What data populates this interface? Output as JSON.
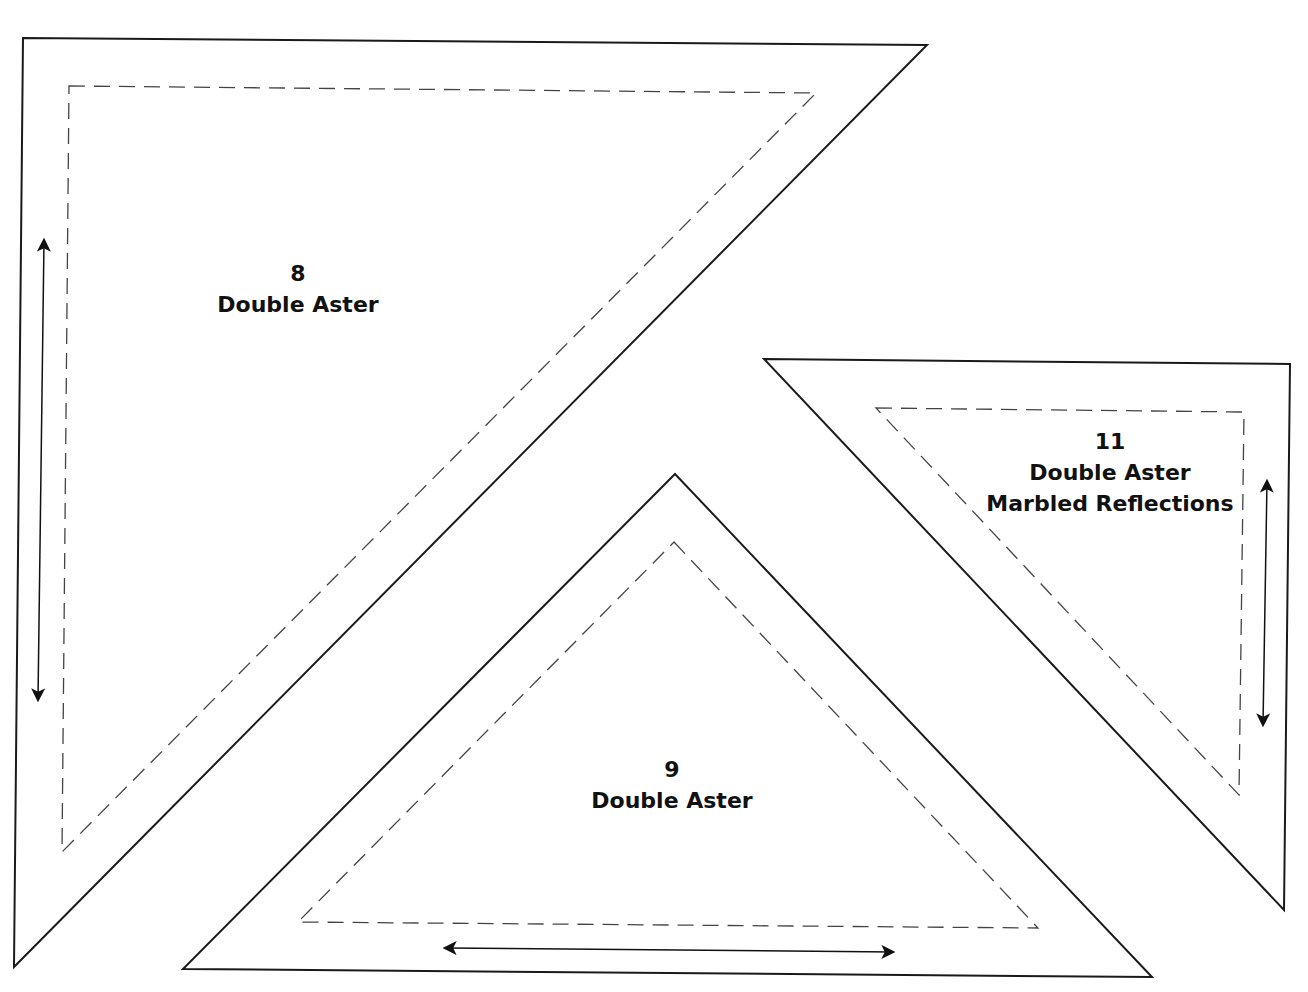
{
  "colors": {
    "background": "#ffffff",
    "cut_line": "#1a1a1a",
    "seam_line": "#444444",
    "grain_arrow": "#111111",
    "text": "#111111"
  },
  "pieces": [
    {
      "number": "8",
      "name": "Double Aster",
      "fabric": "",
      "grain_arrow": "vertical",
      "cut_outline": [
        [
          23,
          38
        ],
        [
          927,
          45
        ],
        [
          14,
          967
        ]
      ],
      "seam_outline": [
        [
          69,
          86
        ],
        [
          816,
          93
        ],
        [
          62,
          852
        ]
      ],
      "arrow": [
        [
          44,
          240
        ],
        [
          38,
          700
        ]
      ],
      "label_pos": [
        298,
        258
      ]
    },
    {
      "number": "9",
      "name": "Double Aster",
      "fabric": "",
      "grain_arrow": "horizontal",
      "cut_outline": [
        [
          675,
          474
        ],
        [
          1152,
          977
        ],
        [
          183,
          969
        ]
      ],
      "seam_outline": [
        [
          674,
          542
        ],
        [
          1038,
          928
        ],
        [
          298,
          922
        ]
      ],
      "arrow": [
        [
          445,
          948
        ],
        [
          893,
          952
        ]
      ],
      "label_pos": [
        672,
        754
      ]
    },
    {
      "number": "11",
      "name": "Double Aster",
      "fabric": "Marbled Reflections",
      "grain_arrow": "vertical",
      "cut_outline": [
        [
          764,
          359
        ],
        [
          1290,
          364
        ],
        [
          1284,
          910
        ]
      ],
      "seam_outline": [
        [
          876,
          408
        ],
        [
          1244,
          412
        ],
        [
          1239,
          795
        ]
      ],
      "arrow": [
        [
          1267,
          481
        ],
        [
          1263,
          725
        ]
      ],
      "label_pos": [
        1110,
        426
      ]
    }
  ]
}
